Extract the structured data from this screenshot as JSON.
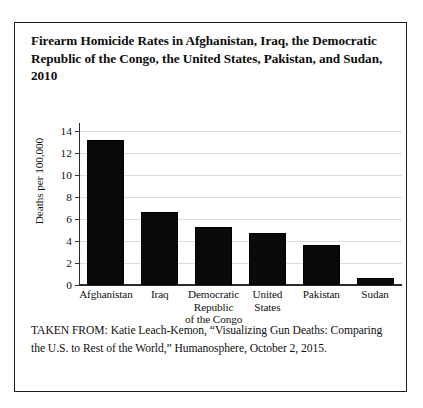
{
  "figure": {
    "title": "Firearm Homicide Rates in Afghanistan, Iraq, the Democratic Republic of the Congo, the United States, Pakistan, and Sudan, 2010",
    "source_note": "TAKEN FROM: Katie Leach-Kemon, “Visualizing Gun Deaths: Comparing the U.S. to Rest of the World,” Humanosphere, October 2, 2015."
  },
  "chart_data": {
    "type": "bar",
    "title": "Firearm Homicide Rates in Afghanistan, Iraq, the Democratic Republic of the Congo, the United States, Pakistan, and Sudan, 2010",
    "xlabel": "",
    "ylabel": "Deaths per 100,000",
    "categories": [
      "Afghanistan",
      "Iraq",
      "Democratic Republic of the Congo",
      "United States",
      "Pakistan",
      "Sudan"
    ],
    "category_lines": [
      [
        "Afghanistan"
      ],
      [
        "Iraq"
      ],
      [
        "Democratic",
        "Republic",
        "of the Congo"
      ],
      [
        "United",
        "States"
      ],
      [
        "Pakistan"
      ],
      [
        "Sudan"
      ]
    ],
    "values": [
      13.2,
      6.6,
      5.3,
      4.7,
      3.6,
      0.6
    ],
    "ylim": [
      0,
      14
    ],
    "yticks": [
      0,
      2,
      4,
      6,
      8,
      10,
      12,
      14
    ],
    "ytick_labels": [
      "0",
      "2",
      "4",
      "6",
      "8",
      "10",
      "12",
      "14"
    ],
    "grid": true,
    "legend": false,
    "bar_color": "#0a0a0a"
  }
}
